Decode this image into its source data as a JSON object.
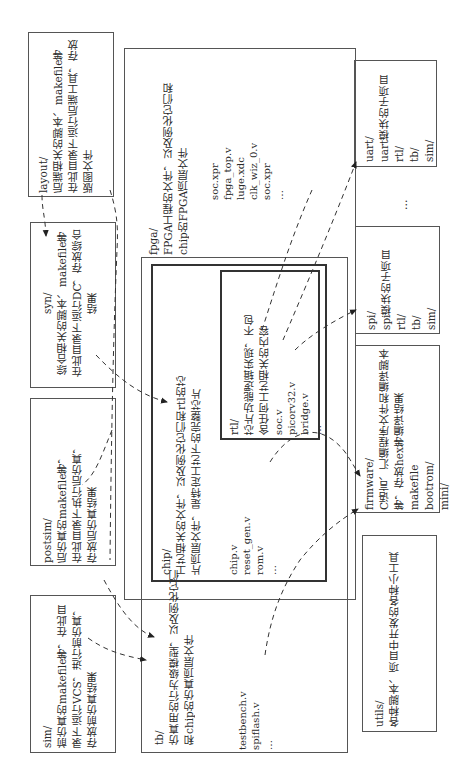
{
  "diagram": {
    "orientation": "rotated-90-ccw",
    "boxes": {
      "layout": {
        "name": "layout/",
        "desc": [
          "后端相关的脚本、makefile等",
          "在此目录下运行后端工具，存放",
          "版图文件"
        ]
      },
      "syn": {
        "name": "syn/",
        "desc": [
          "综合相关的脚本、makefile等",
          "在此目录下运行DC，存放综合",
          "结果"
        ]
      },
      "postsim": {
        "name": "postsim/",
        "desc": [
          "后仿真的makefile等，",
          "在此目录下执行后仿真，",
          "存放后仿真结果"
        ]
      },
      "sim": {
        "name": "sim/",
        "desc": [
          "前仿真的makefile等，在此目",
          "录下运行VCS，进行前仿真，",
          "存放前仿真结果"
        ]
      },
      "fpga": {
        "name": "fpga/",
        "desc": [
          "FPGA工程的文件，以及例化它们和",
          "chip的FPGA顶层文件"
        ],
        "files": [
          "soc.xpr",
          "fpga_top.v",
          "luge.xdc",
          "clk_wiz_0.v",
          "soc.xpr",
          "…"
        ]
      },
      "chip": {
        "name": "chip/",
        "desc": [
          "工艺相关的文件，以及例化它们和rtl的芯",
          "片顶层文件，是特定工艺下的完整芯片"
        ],
        "files": [
          "chip.v",
          "reset_gen.v",
          "rom.v",
          "…"
        ]
      },
      "rtl": {
        "name": "rtl/",
        "desc": [
          "芯片功能逻辑实现，不包",
          "含任何工艺相关的内容"
        ],
        "files": [
          "soc.v",
          "picorv32.v",
          "bridge.v",
          "…"
        ]
      },
      "tb": {
        "name": "tb/",
        "desc": [
          "仿真用的行为级模型，以及例化它们",
          "和chip的仿真顶层文件"
        ],
        "files": [
          "testbench.v",
          "spiflash.v",
          "…"
        ]
      },
      "uart": {
        "name": "uart/",
        "desc": [
          "uart模块的子项目"
        ],
        "files": [
          "rtl/",
          "tb/",
          "sim/"
        ]
      },
      "ellipsis_between": "…",
      "spi": {
        "name": "spi/",
        "desc": [
          "spi模块的子项目"
        ],
        "files": [
          "rtl/",
          "tb/",
          "sim/"
        ]
      },
      "firmware": {
        "name": "firmware/",
        "desc": [
          "C语言、汇编程序文件和编译脚本",
          "等，存放hex等编译结果"
        ],
        "files": [
          "makefile",
          "bootrom/",
          "mini/"
        ]
      },
      "utils": {
        "name": "utils/",
        "desc": [
          "各种脚本、项目中开发的各种小工具"
        ]
      }
    },
    "colors": {
      "line": "#555555",
      "text": "#2a2a2a",
      "background": "#ffffff"
    }
  }
}
